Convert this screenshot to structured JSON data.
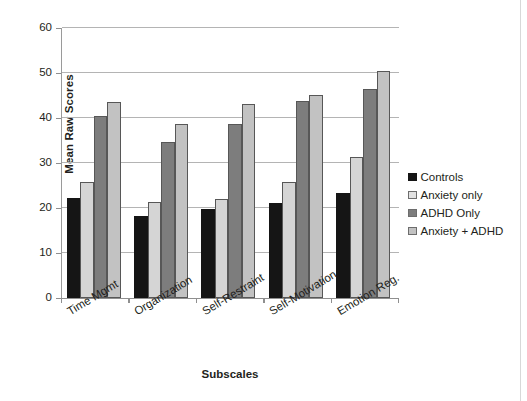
{
  "chart_data": {
    "type": "bar",
    "title": "",
    "xlabel": "Subscales",
    "ylabel": "Mean Raw Scores",
    "categories": [
      "Time Mgmt",
      "Organization",
      "Self-Restraint",
      "Self-Motivation",
      "Emotion Reg."
    ],
    "series": [
      {
        "name": "Controls",
        "color": "#151515",
        "values": [
          22.2,
          18.3,
          19.7,
          21.2,
          23.4
        ]
      },
      {
        "name": "Anxiety only",
        "color": "#d5d5d5",
        "values": [
          25.7,
          21.3,
          22.1,
          25.8,
          31.3
        ]
      },
      {
        "name": "ADHD Only",
        "color": "#7d7d7d",
        "values": [
          40.4,
          34.6,
          38.7,
          43.8,
          46.5
        ]
      },
      {
        "name": "Anxiety + ADHD",
        "color": "#c2c2c2",
        "values": [
          43.5,
          38.7,
          43.1,
          45.2,
          50.4
        ]
      }
    ],
    "ylim": [
      0,
      60
    ],
    "yticks": [
      0,
      10,
      20,
      30,
      40,
      50,
      60
    ],
    "ytick_labels": [
      "0",
      "10",
      "20",
      "30",
      "40",
      "50",
      "60"
    ],
    "grid": "horizontal",
    "legend_position": "right"
  },
  "legend": {
    "items": [
      {
        "label": "Controls"
      },
      {
        "label": "Anxiety only"
      },
      {
        "label": "ADHD Only"
      },
      {
        "label": "Anxiety + ADHD"
      }
    ]
  }
}
